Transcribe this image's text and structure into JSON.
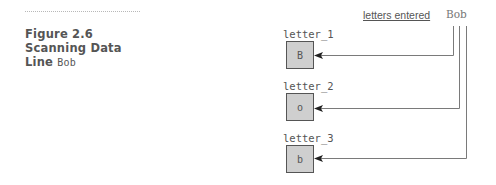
{
  "caption": {
    "line1": "Figure 2.6",
    "line2": "Scanning Data",
    "line3_word": "Line",
    "line3_code": "Bob"
  },
  "header": {
    "label": "letters entered",
    "input": "Bob"
  },
  "variables": [
    {
      "name": "letter_1",
      "value": "B"
    },
    {
      "name": "letter_2",
      "value": "o"
    },
    {
      "name": "letter_3",
      "value": "b"
    }
  ],
  "colors": {
    "box_fill": "#cfcfcf",
    "box_border": "#555555",
    "line": "#777777",
    "text": "#555555"
  }
}
